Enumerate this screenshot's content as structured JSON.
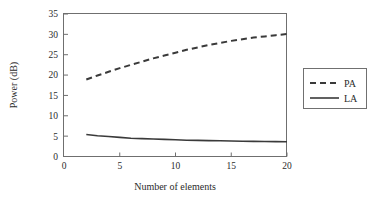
{
  "chart_data": {
    "type": "line",
    "title": "",
    "subtitle": "",
    "xlabel": "Number of elements",
    "ylabel": "Power (dB)",
    "xlim": [
      0,
      20
    ],
    "ylim": [
      0,
      35
    ],
    "xticks": [
      0,
      5,
      10,
      15,
      20
    ],
    "yticks": [
      0,
      5,
      10,
      15,
      20,
      25,
      30,
      35
    ],
    "xtick_labels": [
      "0",
      "5",
      "10",
      "15",
      "20"
    ],
    "ytick_labels": [
      "0",
      "5",
      "10",
      "15",
      "20",
      "25",
      "30",
      "35"
    ],
    "grid": false,
    "legend_position": "right-outside",
    "series": [
      {
        "name": "PA",
        "style": "dashed",
        "color": "#3a3a3a",
        "x": [
          2,
          3,
          4,
          5,
          6,
          7,
          8,
          9,
          10,
          11,
          12,
          13,
          14,
          15,
          16,
          17,
          18,
          19,
          20
        ],
        "values": [
          18.9,
          19.9,
          20.8,
          21.7,
          22.5,
          23.3,
          24.1,
          24.8,
          25.5,
          26.2,
          26.8,
          27.4,
          27.9,
          28.4,
          28.8,
          29.2,
          29.5,
          29.8,
          30.1
        ]
      },
      {
        "name": "LA",
        "style": "solid",
        "color": "#3a3a3a",
        "x": [
          2,
          3,
          4,
          5,
          6,
          7,
          8,
          9,
          10,
          11,
          12,
          13,
          14,
          15,
          16,
          17,
          18,
          19,
          20
        ],
        "values": [
          5.4,
          5.1,
          4.9,
          4.7,
          4.5,
          4.4,
          4.3,
          4.2,
          4.1,
          4.0,
          3.95,
          3.9,
          3.85,
          3.8,
          3.75,
          3.72,
          3.69,
          3.66,
          3.63
        ]
      }
    ]
  },
  "legend": {
    "entries": [
      {
        "label": "PA",
        "style": "dashed"
      },
      {
        "label": "LA",
        "style": "solid"
      }
    ]
  },
  "colors": {
    "line": "#3a3a3a",
    "axis": "#6f6f6f",
    "text": "#2b2b2b",
    "background": "#ffffff"
  }
}
